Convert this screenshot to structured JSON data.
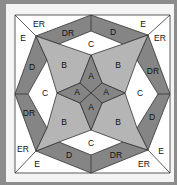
{
  "colors": {
    "background": "#8c8c8c",
    "white": "#ffffff",
    "light": "#b5b5b5",
    "dark": "#858585",
    "line": "#333333"
  },
  "labels": {
    "a_top": "A",
    "a_left": "A",
    "a_right": "A",
    "a_bottom": "A",
    "b_tl": "B",
    "b_tr": "B",
    "b_bl": "B",
    "b_br": "B",
    "c_top": "C",
    "c_left": "C",
    "c_right": "C",
    "c_bottom": "C",
    "dr_top": "DR",
    "d_top": "D",
    "d_left": "D",
    "dr_left": "DR",
    "dr_right": "DR",
    "d_right": "D",
    "d_bottom": "D",
    "dr_bottom": "DR",
    "er_tl": "ER",
    "e_tl": "E",
    "e_tr": "E",
    "er_tr": "ER",
    "er_bl": "ER",
    "e_bl": "E",
    "e_br": "E",
    "er_br": "ER"
  }
}
